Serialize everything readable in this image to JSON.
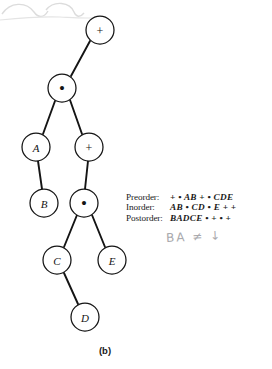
{
  "figure": {
    "caption": "(b)",
    "kind": "binary-expression-tree"
  },
  "tree": {
    "nodes": [
      {
        "id": "n1",
        "label": "+",
        "kind": "operator",
        "cx": 100,
        "cy": 30,
        "r": 14
      },
      {
        "id": "n2",
        "label": "•",
        "kind": "operator",
        "cx": 62,
        "cy": 88,
        "r": 14
      },
      {
        "id": "n3",
        "label": "A",
        "kind": "operand",
        "cx": 36,
        "cy": 147,
        "r": 14
      },
      {
        "id": "n4",
        "label": "+",
        "kind": "operator",
        "cx": 89,
        "cy": 147,
        "r": 14
      },
      {
        "id": "n5",
        "label": "B",
        "kind": "operand",
        "cx": 44,
        "cy": 203,
        "r": 14
      },
      {
        "id": "n6",
        "label": "•",
        "kind": "operator",
        "cx": 84,
        "cy": 203,
        "r": 14
      },
      {
        "id": "n7",
        "label": "C",
        "kind": "operand",
        "cx": 57,
        "cy": 260,
        "r": 14
      },
      {
        "id": "n8",
        "label": "E",
        "kind": "operand",
        "cx": 112,
        "cy": 260,
        "r": 14
      },
      {
        "id": "n9",
        "label": "D",
        "kind": "operand",
        "cx": 85,
        "cy": 317,
        "r": 14
      }
    ],
    "edges": [
      {
        "from": "n1",
        "to": "n2"
      },
      {
        "from": "n2",
        "to": "n3"
      },
      {
        "from": "n2",
        "to": "n4"
      },
      {
        "from": "n3",
        "to": "n5"
      },
      {
        "from": "n4",
        "to": "n6"
      },
      {
        "from": "n6",
        "to": "n7"
      },
      {
        "from": "n6",
        "to": "n8"
      },
      {
        "from": "n7",
        "to": "n9"
      }
    ]
  },
  "traversals": [
    {
      "label": "Preorder:",
      "sequence": "+ • AB + • CDE"
    },
    {
      "label": "Inorder:",
      "sequence": "AB • CD • E + +"
    },
    {
      "label": "Postorder:",
      "sequence": "BADCE • + • +"
    }
  ],
  "annotation": {
    "handwritten": "BA ≠ ↓"
  },
  "colors": {
    "ink": "#141414",
    "paper": "#ffffff",
    "pencil": "#a9a9ad",
    "artifact": "#dcdcdc"
  }
}
